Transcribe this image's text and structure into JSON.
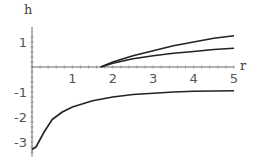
{
  "chart_data": {
    "type": "line",
    "title": "",
    "xlabel": "r",
    "ylabel": "h",
    "xlim": [
      0,
      5
    ],
    "ylim": [
      -3.5,
      1.6
    ],
    "x_ticks": [
      "1",
      "2",
      "3",
      "4",
      "5"
    ],
    "y_ticks": [
      "1",
      "-1",
      "-2",
      "-3"
    ],
    "grid": false,
    "series": [
      {
        "name": "upper branch 1",
        "x": [
          1.7,
          2,
          2.5,
          3,
          3.5,
          4,
          4.5,
          5
        ],
        "y": [
          0,
          0.2,
          0.45,
          0.65,
          0.85,
          1.0,
          1.15,
          1.25
        ]
      },
      {
        "name": "upper branch 2",
        "x": [
          1.7,
          2,
          2.5,
          3,
          3.5,
          4,
          4.5,
          5
        ],
        "y": [
          0,
          0.15,
          0.33,
          0.45,
          0.55,
          0.62,
          0.7,
          0.75
        ]
      },
      {
        "name": "lower branch",
        "x": [
          0,
          0.1,
          0.3,
          0.5,
          0.75,
          1,
          1.5,
          2,
          2.5,
          3,
          3.5,
          4,
          4.5,
          5
        ],
        "y": [
          -3.3,
          -3.2,
          -2.6,
          -2.1,
          -1.8,
          -1.6,
          -1.35,
          -1.2,
          -1.1,
          -1.05,
          -1.0,
          -0.97,
          -0.96,
          -0.95
        ]
      }
    ]
  },
  "labels": {
    "x_axis": "r",
    "y_axis": "h"
  }
}
